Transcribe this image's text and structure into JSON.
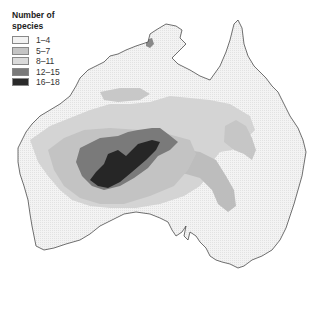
{
  "legend": {
    "title_line1": "Number of",
    "title_line2": "species",
    "items": [
      {
        "label": "1–4",
        "color": "#f2f2f2"
      },
      {
        "label": "5–7",
        "color": "#c4c4c4"
      },
      {
        "label": "8–11",
        "color": "#dadada"
      },
      {
        "label": "12–15",
        "color": "#7a7a7a"
      },
      {
        "label": "16–18",
        "color": "#2a2a2a"
      }
    ]
  },
  "map": {
    "region": "Australia",
    "land_color": "#eeeeee",
    "coast_color": "#333333"
  }
}
